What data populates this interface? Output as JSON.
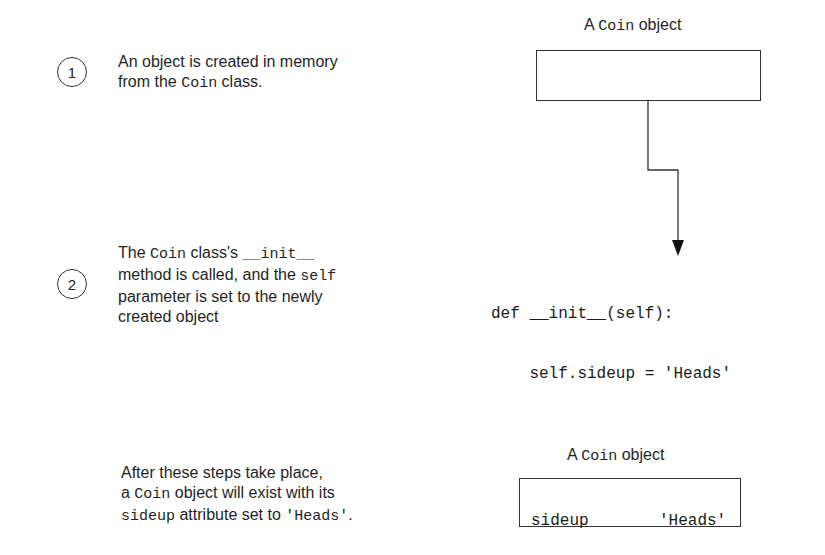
{
  "steps": [
    {
      "number": "1",
      "text_parts": [
        "An object is created in memory",
        "from the ",
        "Coin",
        " class."
      ]
    },
    {
      "number": "2",
      "text_parts": [
        "The ",
        "Coin",
        " class's ",
        "__init__",
        "method is called, and the ",
        "self",
        "parameter is set to the newly",
        "created object"
      ]
    }
  ],
  "object_top": {
    "label_prefix": "A ",
    "label_code": "Coin",
    "label_suffix": " object"
  },
  "code": {
    "line1": "def __init__(self):",
    "line2": "    self.sideup = 'Heads'"
  },
  "summary": {
    "line1": "After these steps take place,",
    "line2_prefix": "a ",
    "line2_code": "Coin",
    "line2_suffix": " object will exist with its",
    "line3_code1": "sideup",
    "line3_mid": " attribute set to ",
    "line3_code2": "'Heads'",
    "line3_end": "."
  },
  "object_bottom": {
    "label_prefix": "A ",
    "label_code": "Coin",
    "label_suffix": " object",
    "attribute": "sideup",
    "value": "'Heads'"
  }
}
